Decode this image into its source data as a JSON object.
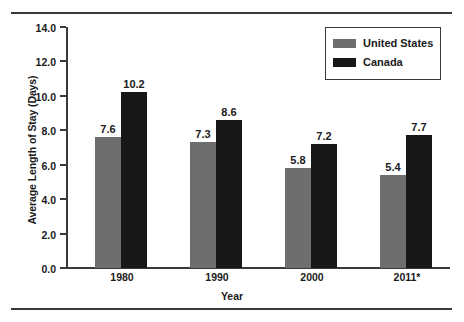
{
  "chart_data": {
    "type": "bar",
    "title": "",
    "xlabel": "Year",
    "ylabel": "Average Length of Stay (Days)",
    "categories": [
      "1980",
      "1990",
      "2000",
      "2011*"
    ],
    "series": [
      {
        "name": "United States",
        "color": "#6e6e6e",
        "values": [
          7.6,
          7.3,
          5.8,
          5.4
        ]
      },
      {
        "name": "Canada",
        "color": "#171717",
        "values": [
          10.2,
          8.6,
          7.2,
          7.7
        ]
      }
    ],
    "ylim": [
      0,
      14
    ],
    "ytick_step": 2,
    "ytick_labels": [
      "0.0",
      "2.0",
      "4.0",
      "6.0",
      "8.0",
      "10.0",
      "12.0",
      "14.0"
    ],
    "value_labels": {
      "United States": [
        "7.6",
        "7.3",
        "5.8",
        "5.4"
      ],
      "Canada": [
        "10.2",
        "8.6",
        "7.2",
        "7.7"
      ]
    },
    "grid": false,
    "legend_position": "top-right",
    "legend_entries": [
      "United States",
      "Canada"
    ]
  }
}
